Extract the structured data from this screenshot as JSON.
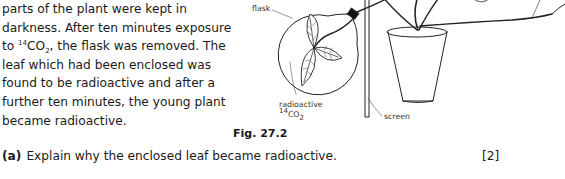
{
  "passage": {
    "lines": [
      "parts of the plant were kept in",
      "darkness. After ten minutes exposure",
      "the flask was removed. The",
      "leaf which had been enclosed was",
      "found to be radioactive and after a",
      "further ten minutes, the young plant",
      "became radioactive."
    ],
    "line3_prefix": "to ",
    "co2_mass": "14",
    "co2_base": "CO",
    "co2_sub": "2",
    "line3_comma": ", "
  },
  "figure": {
    "labels": {
      "flask": "flask",
      "radioactive": "radioactive",
      "co2_mass": "14",
      "co2_base": "CO",
      "co2_sub": "2",
      "screen": "screen"
    },
    "caption": "Fig. 27.2"
  },
  "question": {
    "label": "(a)",
    "text": "Explain why the enclosed leaf became radioactive.",
    "marks": "[2]"
  }
}
